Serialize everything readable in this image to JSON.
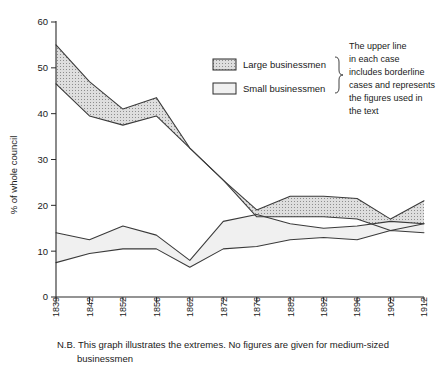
{
  "chart_data": {
    "type": "area",
    "title": "",
    "subtitle": "",
    "xlabel": "",
    "ylabel": "% of whole council",
    "ylim": [
      0,
      60
    ],
    "yticks": [
      0,
      10,
      20,
      30,
      40,
      50,
      60
    ],
    "grid": false,
    "legend_position": "top-right",
    "categories": [
      "1839",
      "1842",
      "1852",
      "1856",
      "1862",
      "1872",
      "1876",
      "1882",
      "1892",
      "1896",
      "1902",
      "1912"
    ],
    "x": [
      "1839",
      "1842",
      "1852",
      "1856",
      "1862",
      "1872",
      "1876",
      "1882",
      "1892",
      "1896",
      "1902",
      "1912"
    ],
    "series": [
      {
        "name": "Large businessmen",
        "role": "upper-bound",
        "values": [
          55.0,
          47.0,
          41.0,
          43.5,
          32.5,
          25.5,
          19.0,
          22.0,
          22.0,
          21.5,
          17.0,
          21.0
        ]
      },
      {
        "name": "Large businessmen",
        "role": "lower-bound",
        "values": [
          46.5,
          39.5,
          37.5,
          39.5,
          32.5,
          25.5,
          17.5,
          17.5,
          17.5,
          17.0,
          14.5,
          16.0
        ]
      },
      {
        "name": "Small businessmen",
        "role": "upper-bound",
        "values": [
          14.0,
          12.5,
          15.5,
          13.5,
          8.0,
          16.5,
          18.0,
          16.0,
          15.0,
          15.5,
          16.5,
          16.0
        ]
      },
      {
        "name": "Small businessmen",
        "role": "lower-bound",
        "values": [
          7.5,
          9.5,
          10.5,
          10.5,
          6.5,
          10.5,
          11.0,
          12.5,
          13.0,
          12.5,
          14.5,
          14.0
        ]
      }
    ],
    "annotations": [
      "The upper line in each case includes borderline cases and represents the figures used in the text",
      "N.B. This graph illustrates the extremes. No figures are given for medium-sized businessmen"
    ],
    "colors": {
      "large_fill": "#d7d7d7",
      "small_fill": "#efefef",
      "line": "#3a3a3a",
      "axis": "#2b2b2b"
    }
  },
  "legend": {
    "items": [
      {
        "label": "Large businessmen",
        "swatch": "hatched-swatch"
      },
      {
        "label": "Small businessmen",
        "swatch": "plain-swatch"
      }
    ]
  },
  "note": {
    "lines": [
      "The upper line",
      "in each case",
      "includes borderline",
      "cases and represents",
      "the figures used in",
      "the text"
    ]
  },
  "caption": {
    "line1": "N.B. This graph illustrates the extremes. No figures are given for medium-sized",
    "line2": "businessmen"
  },
  "axis": {
    "y_label": "% of whole council",
    "y_ticks": [
      "0",
      "10",
      "20",
      "30",
      "40",
      "50",
      "60"
    ],
    "x_ticks": [
      "1839",
      "1842",
      "1852",
      "1856",
      "1862",
      "1872",
      "1876",
      "1882",
      "1892",
      "1896",
      "1902",
      "1912"
    ]
  }
}
